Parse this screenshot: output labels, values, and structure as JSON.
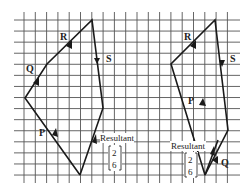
{
  "diagram": {
    "colors": {
      "grid": "#555555",
      "line": "#1a1a1a",
      "background": "#ffffff"
    },
    "left_figure": {
      "labels": {
        "P": "P",
        "Q": "Q",
        "R": "R",
        "S": "S"
      },
      "resultant_label": "Resultant",
      "resultant_vector": {
        "top": "2",
        "bottom": "6"
      }
    },
    "right_figure": {
      "labels": {
        "P": "P",
        "Q": "Q",
        "R": "R",
        "S": "S"
      },
      "resultant_label": "Resultant",
      "resultant_vector": {
        "top": "2",
        "bottom": "6"
      }
    }
  }
}
